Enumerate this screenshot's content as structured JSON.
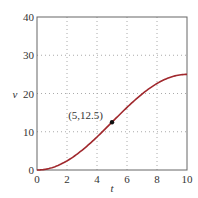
{
  "chart_data": {
    "type": "line",
    "title": "",
    "xlabel": "t",
    "ylabel": "v",
    "xlim": [
      0,
      10
    ],
    "ylim": [
      0,
      40
    ],
    "xticks": [
      0,
      2,
      4,
      6,
      8,
      10
    ],
    "yticks": [
      0,
      10,
      20,
      30,
      40
    ],
    "xtick_labels": [
      "0",
      "2",
      "4",
      "6",
      "8",
      "10"
    ],
    "ytick_labels": [
      "0",
      "10",
      "20",
      "30",
      "40"
    ],
    "grid": true,
    "series": [
      {
        "name": "v(t)",
        "color": "#a0282d",
        "x": [
          0,
          1,
          2,
          3,
          4,
          5,
          6,
          7,
          8,
          9,
          10
        ],
        "values": [
          0,
          0.31,
          1.19,
          2.55,
          4.25,
          6.25,
          8.45,
          10.85,
          13.45,
          16.2,
          25
        ]
      }
    ],
    "curve_formula_hint": "v = 12.5*(1 - cos(pi*t/10)) approx, from 0 to 25",
    "annotations": [
      {
        "text": "(5,12.5)",
        "x": 5,
        "y": 12.5,
        "marker": "dot"
      }
    ]
  }
}
